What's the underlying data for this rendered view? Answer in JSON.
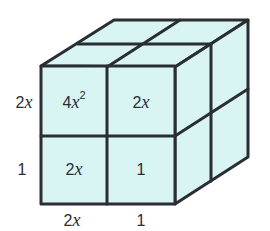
{
  "figure": {
    "fill_color": "#d8f5f3",
    "line_color": "#2a2d33",
    "front_face": {
      "cells": [
        {
          "coef": "4",
          "var": "x",
          "exp": "2"
        },
        {
          "coef": "2",
          "var": "x",
          "exp": ""
        },
        {
          "coef": "2",
          "var": "x",
          "exp": ""
        },
        {
          "coef": "1",
          "var": "",
          "exp": ""
        }
      ]
    },
    "side_labels": {
      "left_top": {
        "coef": "2",
        "var": "x"
      },
      "left_bottom": {
        "coef": "1",
        "var": ""
      },
      "bottom_left": {
        "coef": "2",
        "var": "x"
      },
      "bottom_right": {
        "coef": "1",
        "var": ""
      }
    }
  }
}
